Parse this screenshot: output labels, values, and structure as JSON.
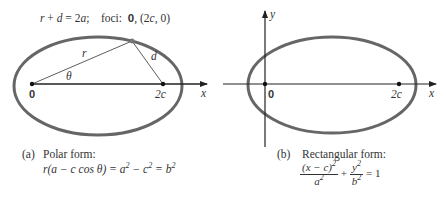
{
  "panel_a": {
    "header": {
      "eq_r": "r",
      "eq_plus": " + ",
      "eq_d": "d",
      "eq_rest": " = 2",
      "eq_a": "a",
      "eq_semi": ";    foci:  ",
      "origin": "0",
      "foci_rest_1": ", (2",
      "foci_c": "c",
      "foci_rest_2": ", 0)"
    },
    "labels": {
      "r": "r",
      "d": "d",
      "theta": "θ",
      "origin": "0",
      "focus": "2c",
      "x_axis": "x"
    },
    "caption": {
      "tag": "(a)",
      "title": "Polar form:",
      "formula_1": "r(a − c cos θ) = a",
      "sup_1": "2",
      "formula_2": " − c",
      "sup_2": "2",
      "formula_3": " = b",
      "sup_3": "2"
    }
  },
  "panel_b": {
    "labels": {
      "y_axis": "y",
      "origin": "0",
      "focus": "2c",
      "x_axis": "x"
    },
    "caption": {
      "tag": "(b)",
      "title": "Rectangular form:",
      "num1": "(x − c)",
      "num1_sup": "2",
      "den1": "a",
      "den1_sup": "2",
      "plus": " + ",
      "num2": "y",
      "num2_sup": "2",
      "den2": "b",
      "den2_sup": "2",
      "equals": " = 1"
    }
  },
  "colors": {
    "ellipse": "#666666",
    "axis": "#222222"
  }
}
